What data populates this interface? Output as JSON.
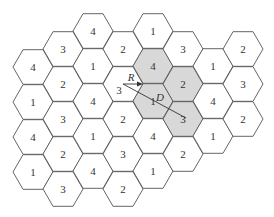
{
  "diagram": {
    "type": "hexagonal-cell-reuse-pattern",
    "reuse_factor_N": 4,
    "hex": {
      "side": 20,
      "orientation": "flat-top"
    },
    "colors": {
      "shaded": "#d8d8d8",
      "stroke": "#555555",
      "background": "#ffffff"
    },
    "cells": [
      {
        "cx": 33,
        "cy": 67,
        "label": "4",
        "shaded": false
      },
      {
        "cx": 33,
        "cy": 102,
        "label": "1",
        "shaded": false
      },
      {
        "cx": 33,
        "cy": 137,
        "label": "4",
        "shaded": false
      },
      {
        "cx": 33,
        "cy": 172,
        "label": "1",
        "shaded": false
      },
      {
        "cx": 63,
        "cy": 49,
        "label": "3",
        "shaded": false
      },
      {
        "cx": 63,
        "cy": 84,
        "label": "2",
        "shaded": false
      },
      {
        "cx": 63,
        "cy": 119,
        "label": "3",
        "shaded": false
      },
      {
        "cx": 63,
        "cy": 154,
        "label": "2",
        "shaded": false
      },
      {
        "cx": 63,
        "cy": 189,
        "label": "3",
        "shaded": false
      },
      {
        "cx": 93,
        "cy": 31,
        "label": "4",
        "shaded": false
      },
      {
        "cx": 93,
        "cy": 66,
        "label": "1",
        "shaded": false
      },
      {
        "cx": 93,
        "cy": 101,
        "label": "4",
        "shaded": false
      },
      {
        "cx": 93,
        "cy": 136,
        "label": "1",
        "shaded": false
      },
      {
        "cx": 93,
        "cy": 171,
        "label": "4",
        "shaded": false
      },
      {
        "cx": 123,
        "cy": 49,
        "label": "2",
        "shaded": false
      },
      {
        "cx": 123,
        "cy": 84,
        "label": "3",
        "shaded": false
      },
      {
        "cx": 123,
        "cy": 119,
        "label": "2",
        "shaded": false
      },
      {
        "cx": 123,
        "cy": 154,
        "label": "3",
        "shaded": false
      },
      {
        "cx": 123,
        "cy": 189,
        "label": "2",
        "shaded": false
      },
      {
        "cx": 153,
        "cy": 31,
        "label": "1",
        "shaded": false
      },
      {
        "cx": 153,
        "cy": 66,
        "label": "4",
        "shaded": true
      },
      {
        "cx": 153,
        "cy": 101,
        "label": "1",
        "shaded": true
      },
      {
        "cx": 153,
        "cy": 136,
        "label": "4",
        "shaded": false
      },
      {
        "cx": 153,
        "cy": 171,
        "label": "1",
        "shaded": false
      },
      {
        "cx": 183,
        "cy": 49,
        "label": "3",
        "shaded": false
      },
      {
        "cx": 183,
        "cy": 84,
        "label": "2",
        "shaded": true
      },
      {
        "cx": 183,
        "cy": 119,
        "label": "3",
        "shaded": true
      },
      {
        "cx": 183,
        "cy": 154,
        "label": "2",
        "shaded": false
      },
      {
        "cx": 213,
        "cy": 66,
        "label": "1",
        "shaded": false
      },
      {
        "cx": 213,
        "cy": 101,
        "label": "4",
        "shaded": false
      },
      {
        "cx": 213,
        "cy": 136,
        "label": "1",
        "shaded": false
      },
      {
        "cx": 243,
        "cy": 49,
        "label": "2",
        "shaded": false
      },
      {
        "cx": 243,
        "cy": 84,
        "label": "3",
        "shaded": false
      },
      {
        "cx": 243,
        "cy": 119,
        "label": "2",
        "shaded": false
      }
    ],
    "annotations": {
      "R": {
        "text": "R",
        "x": 131,
        "y": 77
      },
      "D": {
        "text": "D",
        "x": 160,
        "y": 97
      },
      "r_vector": {
        "x1": 123,
        "y1": 84,
        "x2": 143,
        "y2": 84
      },
      "d_line": {
        "x1": 123,
        "y1": 84,
        "x2": 186,
        "y2": 118
      }
    }
  }
}
